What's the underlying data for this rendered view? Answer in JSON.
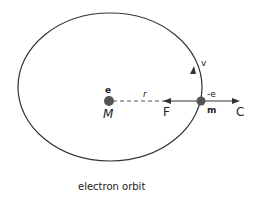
{
  "diagram": {
    "caption": "electron orbit",
    "nucleus_charge": "e",
    "nucleus_mass": "M",
    "electron_charge": "-e",
    "electron_mass": "m",
    "radius_label": "r",
    "force_label": "F",
    "centrifugal_label": "C",
    "velocity_label": "v"
  }
}
